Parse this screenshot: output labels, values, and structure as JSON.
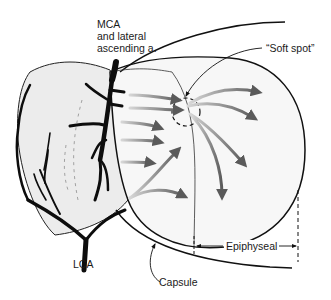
{
  "diagram": {
    "labels": {
      "mca": [
        "MCA",
        "and lateral",
        "ascending a."
      ],
      "soft_spot": "“Soft spot”",
      "lca": "LCA",
      "capsule": "Capsule",
      "epiphyseal": "Epiphyseal"
    },
    "colors": {
      "outline": "#111111",
      "vessel": "#0d0d0d",
      "metaphysis_fill": "#ececec",
      "arrow_dark": "#6a6a6a",
      "arrow_light": "#c4c4c4"
    }
  }
}
